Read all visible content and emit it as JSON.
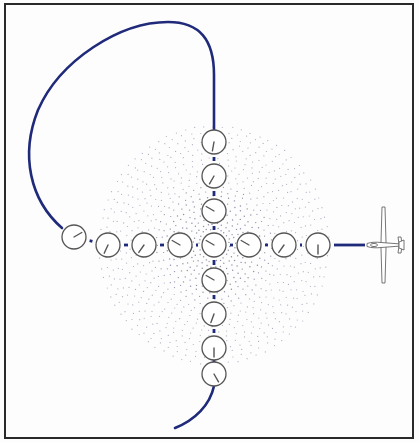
{
  "diagram": {
    "colors": {
      "path": "#1f2a7a",
      "gauge_stroke": "#555555",
      "gauge_fill": "#ffffff",
      "needle": "#555555",
      "dots": "#7a7a9a",
      "frame": "#2a2a2a",
      "glider": "#666666"
    },
    "center": {
      "x": 214,
      "y": 245
    },
    "gauge_radius": 12,
    "horizontal_gauges": [
      {
        "x": 74,
        "y": 237,
        "needle_deg": 60
      },
      {
        "x": 108,
        "y": 245,
        "needle_deg": 205
      },
      {
        "x": 144,
        "y": 245,
        "needle_deg": 215
      },
      {
        "x": 180,
        "y": 245,
        "needle_deg": 300
      },
      {
        "x": 214,
        "y": 245,
        "needle_deg": 300
      },
      {
        "x": 249,
        "y": 245,
        "needle_deg": 300
      },
      {
        "x": 284,
        "y": 245,
        "needle_deg": 215
      },
      {
        "x": 318,
        "y": 245,
        "needle_deg": 180
      }
    ],
    "vertical_gauges": [
      {
        "x": 214,
        "y": 142,
        "needle_deg": 190
      },
      {
        "x": 214,
        "y": 176,
        "needle_deg": 210
      },
      {
        "x": 214,
        "y": 211,
        "needle_deg": 300
      },
      {
        "x": 214,
        "y": 280,
        "needle_deg": 300
      },
      {
        "x": 214,
        "y": 314,
        "needle_deg": 200
      },
      {
        "x": 214,
        "y": 348,
        "needle_deg": 180
      },
      {
        "x": 214,
        "y": 374,
        "needle_deg": 150
      }
    ],
    "glider": {
      "x": 385,
      "y": 245,
      "heading": "left"
    }
  }
}
